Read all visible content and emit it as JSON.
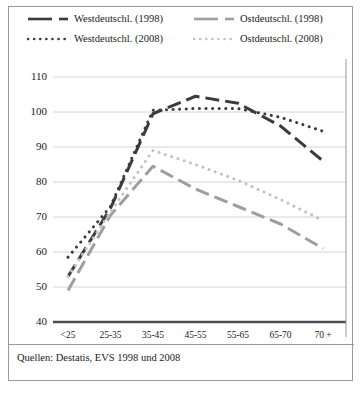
{
  "figure": {
    "source_note": "Quellen: Destatis, EVS 1998 und 2008"
  },
  "colors": {
    "series_west": "#3b3b3b",
    "series_ost": "#9e9e9e",
    "series_ost_light": "#c2c2c2",
    "gridline": "#d4d4d4",
    "axis": "#4d4d4d",
    "frame": "#9a9a9a",
    "text": "#1a1a1a"
  },
  "legend": {
    "entries": [
      {
        "label": "Westdeutschl. (1998)",
        "style": "dashed-long",
        "color": "#3b3b3b"
      },
      {
        "label": "Ostdeutschl. (1998)",
        "style": "dashed-long",
        "color": "#9e9e9e"
      },
      {
        "label": "Westdeutschl. (2008)",
        "style": "dotted",
        "color": "#3b3b3b"
      },
      {
        "label": "Ostdeutschl. (2008)",
        "style": "dotted",
        "color": "#c2c2c2"
      }
    ]
  },
  "chart_data": {
    "type": "line",
    "title": "",
    "subtitle": "",
    "xlabel": "",
    "ylabel": "",
    "categories": [
      "<25",
      "25-35",
      "35-45",
      "45-55",
      "55-65",
      "65-70",
      "70 +"
    ],
    "ylim": [
      40,
      115
    ],
    "yticks": [
      40,
      50,
      60,
      70,
      80,
      90,
      100,
      110
    ],
    "grid": true,
    "legend_position": "top",
    "series": [
      {
        "name": "Westdeutschl. (1998)",
        "style": "dashed-long",
        "color": "#3b3b3b",
        "values": [
          53,
          72.5,
          99.5,
          104.5,
          102.5,
          96,
          86
        ]
      },
      {
        "name": "Ostdeutschl. (1998)",
        "style": "dashed-long",
        "color": "#9e9e9e",
        "values": [
          49,
          70.5,
          84.5,
          78,
          73,
          68,
          61
        ]
      },
      {
        "name": "Westdeutschl. (2008)",
        "style": "dotted",
        "color": "#3b3b3b",
        "values": [
          58.5,
          73,
          100.5,
          101,
          101,
          98.5,
          94.5
        ]
      },
      {
        "name": "Ostdeutschl. (2008)",
        "style": "dotted",
        "color": "#c2c2c2",
        "values": [
          53,
          71.5,
          89,
          85,
          80.5,
          75,
          69
        ]
      }
    ]
  }
}
